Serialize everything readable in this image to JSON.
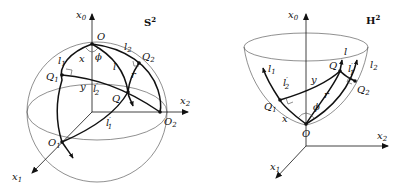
{
  "sphere": {
    "title": "S",
    "title_sup": "2",
    "axes": [
      {
        "base": "x",
        "sub": "0"
      },
      {
        "base": "x",
        "sub": "1"
      },
      {
        "base": "x",
        "sub": "2"
      }
    ],
    "points": [
      {
        "base": "O",
        "sub": ""
      },
      {
        "base": "O",
        "sub": "1"
      },
      {
        "base": "O",
        "sub": "2"
      },
      {
        "base": "Q",
        "sub": ""
      },
      {
        "base": "Q",
        "sub": "1"
      },
      {
        "base": "Q",
        "sub": "2"
      }
    ],
    "lines": [
      {
        "base": "l",
        "sub": "1",
        "prime": ""
      },
      {
        "base": "l",
        "sub": "2",
        "prime": ""
      },
      {
        "base": "l",
        "sub": "",
        "prime": ""
      },
      {
        "base": "l",
        "sub": "1",
        "prime": "′"
      },
      {
        "base": "l",
        "sub": "2",
        "prime": "′"
      }
    ],
    "lengths": [
      "x",
      "y",
      "r"
    ],
    "angle": "ϕ"
  },
  "hyperboloid": {
    "title": "H",
    "title_sup": "2",
    "axes": [
      {
        "base": "x",
        "sub": "0"
      },
      {
        "base": "x",
        "sub": "1"
      },
      {
        "base": "x",
        "sub": "2"
      }
    ],
    "points": [
      {
        "base": "O",
        "sub": ""
      },
      {
        "base": "Q",
        "sub": ""
      },
      {
        "base": "Q",
        "sub": "1"
      },
      {
        "base": "Q",
        "sub": "2"
      }
    ],
    "lines": [
      {
        "base": "l",
        "sub": "1",
        "prime": ""
      },
      {
        "base": "l",
        "sub": "2",
        "prime": ""
      },
      {
        "base": "l",
        "sub": "",
        "prime": ""
      },
      {
        "base": "l",
        "sub": "1",
        "prime": "′"
      },
      {
        "base": "l",
        "sub": "2",
        "prime": "′"
      }
    ],
    "lengths": [
      "x",
      "y",
      "r"
    ],
    "angle": "ϕ"
  }
}
